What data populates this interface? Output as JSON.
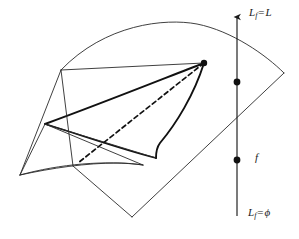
{
  "figure": {
    "background_color": "#ffffff",
    "stroke_color": "#1a1a1a",
    "width": 299,
    "height": 239
  },
  "axis": {
    "name": "vertical-fibration-axis",
    "x": 237,
    "arrow_tip_y": 12,
    "bottom_y": 216,
    "labels": {
      "top": {
        "base": "L",
        "sub": "f",
        "eq": "=",
        "value": "L"
      },
      "middle": {
        "text": "f"
      },
      "bottom": {
        "base": "L",
        "sub": "f",
        "eq": "=",
        "value": "ϕ"
      }
    },
    "nodes": [
      {
        "name": "node-upper",
        "x": 237,
        "y": 82
      },
      {
        "name": "node-lower",
        "x": 237,
        "y": 160
      }
    ]
  },
  "surface": {
    "name": "curved-sheet",
    "description": "large curved quadrilateral sheet spanning the figure"
  },
  "cone": {
    "name": "cone-fin",
    "apex": {
      "x": 204,
      "y": 63
    },
    "left_vertex": {
      "x": 45,
      "y": 124
    },
    "bottom_vertex": {
      "x": 156,
      "y": 158
    },
    "dashed_endpoint": {
      "x": 78,
      "y": 163
    },
    "dashed": true
  },
  "marks": {
    "apex_dot": {
      "x": 204,
      "y": 63,
      "r": 3.2
    }
  }
}
